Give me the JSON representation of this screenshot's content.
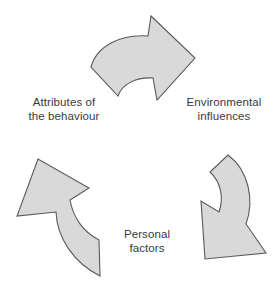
{
  "diagram": {
    "type": "cycle",
    "background_color": "#ffffff",
    "arrow_fill_color": "#d9d9d9",
    "arrow_stroke_color": "#595959",
    "text_color": "#3a3a3a",
    "nodes": [
      {
        "id": "attributes",
        "line1": "Attributes of",
        "line2": "the behaviour",
        "position": "left"
      },
      {
        "id": "environmental",
        "line1": "Environmental",
        "line2": "influences",
        "position": "right"
      },
      {
        "id": "personal",
        "line1": "Personal",
        "line2": "factors",
        "position": "bottom"
      }
    ],
    "arrows": [
      {
        "id": "arrow-top",
        "name": "top-curved-arrow",
        "direction": "clockwise-right"
      },
      {
        "id": "arrow-right",
        "name": "right-curved-arrow",
        "direction": "clockwise-down-left"
      },
      {
        "id": "arrow-left",
        "name": "left-curved-arrow",
        "direction": "clockwise-up-left"
      }
    ]
  }
}
